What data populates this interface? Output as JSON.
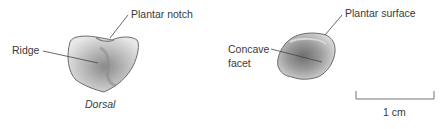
{
  "figure": {
    "left_view": {
      "caption": "Dorsal",
      "labels": {
        "plantar_notch": "Plantar notch",
        "ridge": "Ridge"
      }
    },
    "right_view": {
      "labels": {
        "plantar_surface": "Plantar surface",
        "concave_facet_line1": "Concave",
        "concave_facet_line2": "facet"
      }
    },
    "scale_bar": {
      "label": "1 cm"
    },
    "colors": {
      "bone_outline": "#6b6b6b",
      "bone_shade_dark": "#7d7d7d",
      "bone_shade_light": "#e6e6e6",
      "leader_line": "#444444",
      "text": "#3a3a3a"
    }
  }
}
